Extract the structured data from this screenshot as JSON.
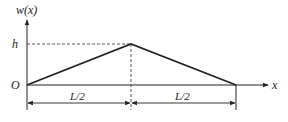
{
  "diagram": {
    "type": "triangular-deflection-profile",
    "axes": {
      "y_label": "w(x)",
      "x_label": "x",
      "origin_label": "O"
    },
    "peak": {
      "label": "h",
      "position": "L/2"
    },
    "dimensions": [
      {
        "label": "L/2",
        "segment": "left"
      },
      {
        "label": "L/2",
        "segment": "right"
      }
    ],
    "colors": {
      "line": "#222222",
      "dashed": "#444444"
    }
  }
}
